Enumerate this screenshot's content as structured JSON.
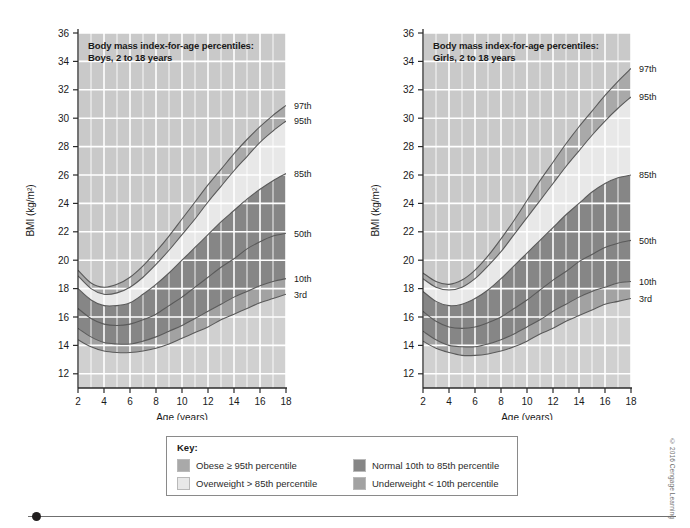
{
  "figure": {
    "copyright": "© 2016 Cengage Learning"
  },
  "panels": [
    {
      "id": "boys",
      "title": "Body mass index-for-age percentiles:\nBoys, 2 to 18 years",
      "xlabel": "Age (years)",
      "ylabel": "BMI (kg/m²)",
      "curve_labels": [
        {
          "name": "97th",
          "bmi_at_18": 30.9
        },
        {
          "name": "95th",
          "bmi_at_18": 29.8
        },
        {
          "name": "85th",
          "bmi_at_18": 26.1
        },
        {
          "name": "50th",
          "bmi_at_18": 21.9
        },
        {
          "name": "10th",
          "bmi_at_18": 18.7
        },
        {
          "name": "3rd",
          "bmi_at_18": 17.6
        }
      ]
    },
    {
      "id": "girls",
      "title": "Body mass index-for-age percentiles:\nGirls, 2 to 18 years",
      "xlabel": "Age (years)",
      "ylabel": "BMI (kg/m²)",
      "curve_labels": [
        {
          "name": "97th",
          "bmi_at_18": 33.5
        },
        {
          "name": "95th",
          "bmi_at_18": 31.5
        },
        {
          "name": "85th",
          "bmi_at_18": 26.0
        },
        {
          "name": "50th",
          "bmi_at_18": 21.4
        },
        {
          "name": "10th",
          "bmi_at_18": 18.5
        },
        {
          "name": "3rd",
          "bmi_at_18": 17.3
        }
      ]
    }
  ],
  "key": {
    "title": "Key:",
    "items": [
      {
        "label": "Obese ≥ 95th percentile",
        "color": "#a9a9a9",
        "col": 0,
        "row": 0
      },
      {
        "label": "Overweight > 85th percentile",
        "color": "#e8e8e8",
        "col": 0,
        "row": 1
      },
      {
        "label": "Normal 10th to 85th percentile",
        "color": "#868686",
        "col": 1,
        "row": 0
      },
      {
        "label": "Underweight < 10th percentile",
        "color": "#a2a2a2",
        "col": 1,
        "row": 1
      }
    ]
  },
  "chart_data": {
    "type": "line",
    "xlabel": "Age (years)",
    "ylabel": "BMI (kg/m²)",
    "xlim": [
      2,
      18
    ],
    "ylim": [
      11,
      36
    ],
    "xticks": [
      2,
      4,
      6,
      8,
      10,
      12,
      14,
      16,
      18
    ],
    "yticks": [
      12,
      14,
      16,
      18,
      20,
      22,
      24,
      26,
      28,
      30,
      32,
      34,
      36
    ],
    "grid": true,
    "legend": "right-of-axis curve end labels",
    "x": [
      2,
      3,
      4,
      5,
      6,
      7,
      8,
      9,
      10,
      11,
      12,
      13,
      14,
      15,
      16,
      17,
      18
    ],
    "panels": [
      {
        "name": "Boys, 2 to 18 years",
        "series": [
          {
            "name": "97th",
            "values": [
              19.3,
              18.4,
              18.1,
              18.3,
              18.8,
              19.6,
              20.6,
              21.7,
              22.9,
              24.1,
              25.3,
              26.4,
              27.5,
              28.5,
              29.4,
              30.2,
              30.9
            ]
          },
          {
            "name": "95th",
            "values": [
              18.9,
              18.0,
              17.6,
              17.7,
              18.1,
              18.8,
              19.7,
              20.7,
              21.8,
              22.9,
              24.1,
              25.2,
              26.3,
              27.3,
              28.3,
              29.1,
              29.8
            ]
          },
          {
            "name": "85th",
            "values": [
              18.0,
              17.2,
              16.8,
              16.8,
              17.0,
              17.6,
              18.3,
              19.1,
              20.0,
              20.9,
              21.8,
              22.7,
              23.5,
              24.3,
              25.0,
              25.6,
              26.1
            ]
          },
          {
            "name": "50th",
            "values": [
              16.6,
              15.9,
              15.5,
              15.4,
              15.5,
              15.8,
              16.2,
              16.8,
              17.4,
              18.1,
              18.8,
              19.5,
              20.1,
              20.8,
              21.3,
              21.7,
              21.9
            ]
          },
          {
            "name": "10th",
            "values": [
              15.2,
              14.6,
              14.2,
              14.1,
              14.1,
              14.3,
              14.6,
              15.0,
              15.4,
              15.9,
              16.4,
              16.9,
              17.4,
              17.8,
              18.2,
              18.5,
              18.7
            ]
          },
          {
            "name": "3rd",
            "values": [
              14.4,
              13.9,
              13.6,
              13.5,
              13.5,
              13.6,
              13.8,
              14.1,
              14.5,
              14.9,
              15.3,
              15.8,
              16.2,
              16.6,
              17.0,
              17.3,
              17.6
            ]
          }
        ]
      },
      {
        "name": "Girls, 2 to 18 years",
        "series": [
          {
            "name": "97th",
            "values": [
              19.1,
              18.5,
              18.3,
              18.6,
              19.3,
              20.3,
              21.5,
              22.8,
              24.2,
              25.6,
              26.9,
              28.2,
              29.4,
              30.5,
              31.6,
              32.6,
              33.5
            ]
          },
          {
            "name": "95th",
            "values": [
              18.7,
              18.1,
              17.9,
              18.1,
              18.7,
              19.6,
              20.6,
              21.8,
              23.0,
              24.2,
              25.4,
              26.6,
              27.7,
              28.8,
              29.8,
              30.7,
              31.5
            ]
          },
          {
            "name": "85th",
            "values": [
              17.8,
              17.1,
              16.8,
              16.9,
              17.3,
              17.9,
              18.7,
              19.6,
              20.5,
              21.4,
              22.3,
              23.2,
              24.0,
              24.8,
              25.4,
              25.8,
              26.0
            ]
          },
          {
            "name": "50th",
            "values": [
              16.4,
              15.7,
              15.3,
              15.2,
              15.3,
              15.6,
              16.0,
              16.6,
              17.2,
              17.9,
              18.6,
              19.2,
              19.9,
              20.4,
              20.9,
              21.2,
              21.4
            ]
          },
          {
            "name": "10th",
            "values": [
              15.0,
              14.4,
              14.0,
              13.9,
              13.9,
              14.1,
              14.4,
              14.8,
              15.3,
              15.8,
              16.4,
              16.9,
              17.4,
              17.8,
              18.1,
              18.4,
              18.5
            ]
          },
          {
            "name": "3rd",
            "values": [
              14.3,
              13.8,
              13.5,
              13.3,
              13.3,
              13.4,
              13.6,
              13.9,
              14.3,
              14.8,
              15.2,
              15.7,
              16.1,
              16.5,
              16.9,
              17.1,
              17.3
            ]
          }
        ]
      }
    ],
    "band_colors": {
      "above_97th": "#c9c9c9",
      "obese_95_97": "#a9a9a9",
      "overweight_85_95": "#e8e8e8",
      "normal_10_85": "#868686",
      "underweight_3_10": "#a2a2a2",
      "below_3rd": "#d0d0d0",
      "curve_line": "#5a5a5a",
      "gridline": "#ffffff"
    }
  }
}
